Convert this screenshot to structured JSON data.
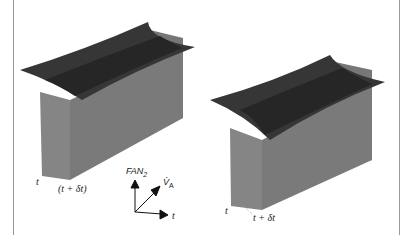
{
  "figure": {
    "panels": [
      {
        "id": "left",
        "labels": {
          "time_start": "t",
          "time_end": "(t + δt)"
        }
      },
      {
        "id": "right",
        "labels": {
          "time_start": "t",
          "time_end": "t + δt"
        }
      }
    ],
    "axes": {
      "vertical": "FAN",
      "vertical_subscript": "2",
      "diagonal": "V̇",
      "diagonal_subscript": "A",
      "horizontal": "t"
    },
    "colors": {
      "surface_dark": "#3a3a3a",
      "surface_mid": "#2a2a2a",
      "side_face": "#7d7d7d",
      "front_face": "#8a8a8a",
      "frame": "#9a9a9a"
    }
  }
}
